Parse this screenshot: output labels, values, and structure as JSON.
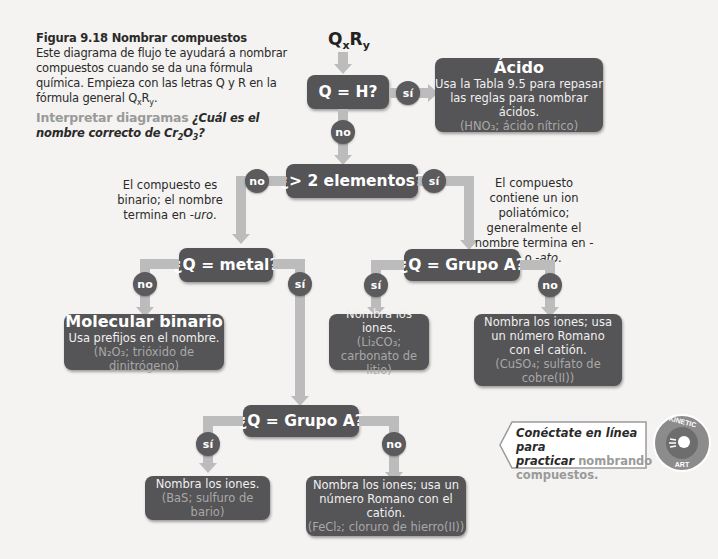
{
  "caption": {
    "title": "Figura 9.18  Nombrar compuestos",
    "body": "Este diagrama de flujo te ayudará a nombrar compuestos cuando se da una fórmula química. Empieza con las letras Q y R en la fórmula general QxRy.",
    "interpret_label": "Interpretar diagramas",
    "question": "¿Cuál es el nombre correcto de Cr2O3?"
  },
  "start": {
    "q": "Q",
    "x": "x",
    "r": "R",
    "y": "y"
  },
  "nodes": {
    "q_h": "Q = H?",
    "gt2": "¿> 2 elementos?",
    "metal": "¿Q = metal?",
    "grupoA_poly": "¿Q = Grupo A?",
    "grupoA_bin": "¿Q = Grupo A?"
  },
  "results": {
    "acido": {
      "title": "Ácido",
      "text": "Usa la Tabla 9.5 para repasar las reglas para nombrar ácidos.",
      "example": "(HNO₃; ácido nítrico)"
    },
    "molecular": {
      "title": "Molecular binario",
      "text": "Usa prefijos en el nombre.",
      "example": "(N₂O₃; trióxido de dinitrógeno)"
    },
    "poly_yes": {
      "text": "Nombra los iones.",
      "example": "(Li₂CO₃; carbonato de litio)"
    },
    "poly_no": {
      "text": "Nombra los iones; usa un número Romano con el catión.",
      "example": "(CuSO₄; sulfato de cobre(II))"
    },
    "bin_yes": {
      "text": "Nombra los iones.",
      "example": "(BaS; sulfuro de bario)"
    },
    "bin_no": {
      "text": "Nombra los iones; usa un número Romano con el catión.",
      "example": "(FeCl₂; cloruro de hierro(II))"
    }
  },
  "labels": {
    "yes": "sí",
    "no": "no"
  },
  "notes": {
    "binary": "El compuesto es binario; el nombre termina en",
    "binary_suffix": "-uro",
    "poly": "El compuesto contiene un ion poliatómico; generalmente el nombre termina en",
    "poly_suffix1": "-ito",
    "poly_or": "o",
    "poly_suffix2": "-ato"
  },
  "online": {
    "line1": "Conéctate en línea para",
    "line2a": "practicar",
    "line2b": "nombrando",
    "line3": "compuestos.",
    "badge_top": "KINETIC",
    "badge_bottom": "ART"
  },
  "colors": {
    "node": "#555456",
    "pipe": "#bdbcbc",
    "example_text": "#a8a8a8",
    "background": "#f4f3f1"
  }
}
